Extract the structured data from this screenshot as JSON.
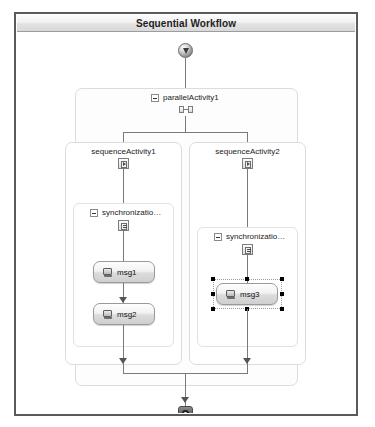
{
  "window": {
    "title": "Sequential Workflow"
  },
  "workflow": {
    "start_node": "start-node",
    "end_node": "end-node",
    "parallel_activity": {
      "label": "parallelActivity1",
      "expander": "collapse-box",
      "icon": "parallel-split-icon"
    },
    "branches": [
      {
        "title": "sequenceActivity1",
        "icon": "sequence-activity-icon",
        "scope": {
          "label": "synchronizatio…",
          "expander": "collapse-box",
          "icon": "synchronization-scope-icon"
        },
        "activities": [
          {
            "label": "msg1",
            "icon": "message-activity-icon",
            "selected": false
          },
          {
            "label": "msg2",
            "icon": "message-activity-icon",
            "selected": false
          }
        ]
      },
      {
        "title": "sequenceActivity2",
        "icon": "sequence-activity-icon",
        "scope": {
          "label": "synchronizatio…",
          "expander": "collapse-box",
          "icon": "synchronization-scope-icon"
        },
        "activities": [
          {
            "label": "msg3",
            "icon": "message-activity-icon",
            "selected": true
          }
        ]
      }
    ]
  },
  "colors": {
    "frame_border": "#5a5a5a",
    "connector": "#7a7a7a",
    "container_border": "#dcdcdc",
    "titlebar_text": "#1d1d1d",
    "selection_handle": "#000000"
  }
}
